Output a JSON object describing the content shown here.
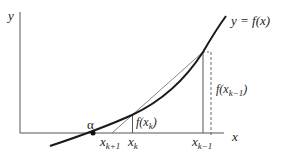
{
  "diagram": {
    "axes": {
      "y_label": "y",
      "x_label": "x"
    },
    "curve_label": "y = f(x)",
    "root_label": "α",
    "points": [
      {
        "name": "x_{k+1}",
        "base": "x",
        "sub": "k+1"
      },
      {
        "name": "x_k",
        "base": "x",
        "sub": "k"
      },
      {
        "name": "x_{k-1}",
        "base": "x",
        "sub": "k−1"
      }
    ],
    "values": [
      {
        "name": "f(x_k)",
        "pre": "f(x",
        "sub": "k",
        "post": ")"
      },
      {
        "name": "f(x_{k-1})",
        "pre": "f(x",
        "sub": "k−1",
        "post": ")"
      }
    ],
    "colors": {
      "curve": "#1a1a1a",
      "axis": "#444444",
      "secant": "#666666"
    }
  }
}
